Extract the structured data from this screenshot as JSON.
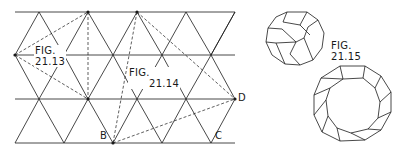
{
  "figures": {
    "fig_21_13": {
      "line1": "FIG.",
      "line2": "21.13"
    },
    "fig_21_14": {
      "line1": "FIG.",
      "line2": "21.14"
    },
    "fig_21_15": {
      "line1": "FIG.",
      "line2": "21.15"
    }
  },
  "points": {
    "B": "B",
    "C": "C",
    "D": "D"
  },
  "colors": {
    "line": "#1a1a1a",
    "background": "#ffffff"
  },
  "grid": {
    "rows_y": [
      12,
      55,
      99,
      143
    ],
    "x_start": 15,
    "x_end": 235,
    "spacing": 49
  }
}
